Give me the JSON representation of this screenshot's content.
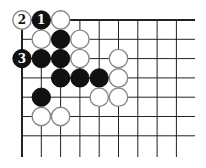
{
  "diagram": {
    "type": "go-board-corner",
    "grid": {
      "cols": 9,
      "rows": 7,
      "origin_x": 22,
      "origin_y": 20,
      "spacing": 19.3,
      "line_right_extent": 195,
      "line_bottom_extent": 157,
      "edge_top": true,
      "edge_left": true
    },
    "colors": {
      "black_stone": "#111111",
      "white_stone": "#ffffff",
      "white_stone_border": "#888888",
      "grid_line": "#222222"
    },
    "stones": [
      {
        "color": "white",
        "col": 0,
        "row": 0,
        "label": "2"
      },
      {
        "color": "black",
        "col": 1,
        "row": 0,
        "label": "1"
      },
      {
        "color": "white",
        "col": 2,
        "row": 0,
        "label": ""
      },
      {
        "color": "white",
        "col": 1,
        "row": 1,
        "label": ""
      },
      {
        "color": "black",
        "col": 2,
        "row": 1,
        "label": ""
      },
      {
        "color": "white",
        "col": 3,
        "row": 1,
        "label": ""
      },
      {
        "color": "black",
        "col": 0,
        "row": 2,
        "label": "3"
      },
      {
        "color": "black",
        "col": 1,
        "row": 2,
        "label": ""
      },
      {
        "color": "black",
        "col": 2,
        "row": 2,
        "label": ""
      },
      {
        "color": "white",
        "col": 3,
        "row": 2,
        "label": ""
      },
      {
        "color": "white",
        "col": 5,
        "row": 2,
        "label": ""
      },
      {
        "color": "black",
        "col": 2,
        "row": 3,
        "label": ""
      },
      {
        "color": "black",
        "col": 3,
        "row": 3,
        "label": ""
      },
      {
        "color": "black",
        "col": 4,
        "row": 3,
        "label": ""
      },
      {
        "color": "white",
        "col": 5,
        "row": 3,
        "label": ""
      },
      {
        "color": "black",
        "col": 1,
        "row": 4,
        "label": ""
      },
      {
        "color": "white",
        "col": 4,
        "row": 4,
        "label": ""
      },
      {
        "color": "white",
        "col": 5,
        "row": 4,
        "label": ""
      },
      {
        "color": "white",
        "col": 1,
        "row": 5,
        "label": ""
      },
      {
        "color": "white",
        "col": 2,
        "row": 5,
        "label": ""
      }
    ]
  }
}
